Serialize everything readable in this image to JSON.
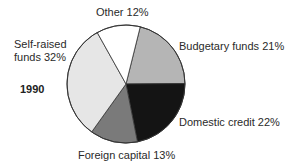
{
  "chart_data": {
    "type": "pie",
    "title": "1990",
    "categories": [
      "Budgetary funds",
      "Domestic credit",
      "Foreign capital",
      "Self-raised funds",
      "Other"
    ],
    "values": [
      21,
      22,
      13,
      32,
      12
    ],
    "unit": "%",
    "colors": [
      "#b5b5b5",
      "#141414",
      "#7a7a7a",
      "#e6e6e6",
      "#ffffff"
    ],
    "start_angle_deg": 14,
    "direction": "clockwise",
    "legend": "none (direct slice labels)"
  },
  "labels": {
    "year": "1990",
    "other": "Other  12%",
    "self_raised_line1": "Self-raised",
    "self_raised_line2": "funds  32%",
    "budgetary": "Budgetary funds  21%",
    "domestic": "Domestic credit  22%",
    "foreign": "Foreign capital  13%"
  }
}
